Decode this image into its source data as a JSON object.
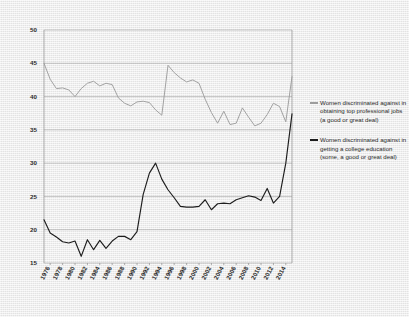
{
  "chart_data": {
    "type": "line",
    "title": "",
    "xlabel": "",
    "ylabel": "",
    "ylim": [
      15,
      50
    ],
    "yticks": [
      15,
      20,
      25,
      30,
      35,
      40,
      45,
      50
    ],
    "xticks": [
      "1976",
      "1978",
      "1980",
      "1982",
      "1984",
      "1986",
      "1988",
      "1990",
      "1992",
      "1994",
      "1996",
      "1998",
      "2000",
      "2002",
      "2004",
      "2006",
      "2008",
      "2010",
      "2012",
      "2014"
    ],
    "xlim": [
      1975,
      2015
    ],
    "grid": true,
    "legend_position": "right",
    "series": [
      {
        "name": "Women discriminated against in obtaining top professional jobs (a good or great deal)",
        "color": "#9d9d9d",
        "x": [
          1975,
          1976,
          1977,
          1978,
          1979,
          1980,
          1981,
          1982,
          1983,
          1984,
          1985,
          1986,
          1987,
          1988,
          1989,
          1990,
          1991,
          1992,
          1993,
          1994,
          1995,
          1996,
          1997,
          1998,
          1999,
          2000,
          2001,
          2002,
          2003,
          2004,
          2005,
          2006,
          2007,
          2008,
          2009,
          2010,
          2011,
          2012,
          2013,
          2014,
          2015
        ],
        "values": [
          45.0,
          42.6,
          41.2,
          41.3,
          41.0,
          40.0,
          41.2,
          42.0,
          42.3,
          41.6,
          42.0,
          41.8,
          39.8,
          39.0,
          38.6,
          39.2,
          39.3,
          39.1,
          38.0,
          37.2,
          44.7,
          43.6,
          42.8,
          42.2,
          42.5,
          42.0,
          39.6,
          37.6,
          36.0,
          37.8,
          35.8,
          36.0,
          38.3,
          36.9,
          35.6,
          36.0,
          37.3,
          39.0,
          38.5,
          36.2,
          43.0
        ]
      },
      {
        "name": "Women discriminated against in getting a college education (some, a good or great deal)",
        "color": "#1d1d1d",
        "x": [
          1975,
          1976,
          1977,
          1978,
          1979,
          1980,
          1981,
          1982,
          1983,
          1984,
          1985,
          1986,
          1987,
          1988,
          1989,
          1990,
          1991,
          1992,
          1993,
          1994,
          1995,
          1996,
          1997,
          1998,
          1999,
          2000,
          2001,
          2002,
          2003,
          2004,
          2005,
          2006,
          2007,
          2008,
          2009,
          2010,
          2011,
          2012,
          2013,
          2014,
          2015
        ],
        "values": [
          21.5,
          19.5,
          18.9,
          18.2,
          18.0,
          18.3,
          16.0,
          18.5,
          17.0,
          18.4,
          17.2,
          18.3,
          19.0,
          19.0,
          18.5,
          19.7,
          25.3,
          28.5,
          30.0,
          27.6,
          26.0,
          24.8,
          23.5,
          23.4,
          23.4,
          23.5,
          24.5,
          23.0,
          23.9,
          24.0,
          23.9,
          24.5,
          24.8,
          25.1,
          24.9,
          24.4,
          26.2,
          24.0,
          25.0,
          30.0,
          37.4
        ]
      }
    ]
  },
  "legend": [
    {
      "label": "Women discriminated against in obtaining top professional jobs (a good or great deal)",
      "color": "#9d9d9d"
    },
    {
      "label": "Women discriminated against in getting a college education (some, a good or great deal)",
      "color": "#1d1d1d"
    }
  ]
}
